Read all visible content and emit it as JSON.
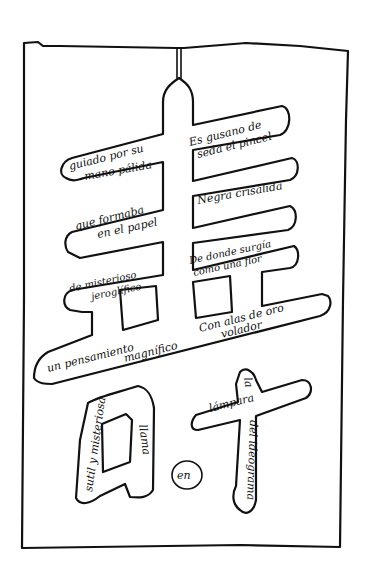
{
  "artwork": {
    "type": "calligram",
    "colors": {
      "ink": "#111111",
      "paper": "#ffffff"
    },
    "upper_character": {
      "lines": [
        {
          "id": "l1a",
          "text": "guiado por su"
        },
        {
          "id": "l1b",
          "text": "mano pálida"
        },
        {
          "id": "l2a",
          "text": "Es gusano de"
        },
        {
          "id": "l2b",
          "text": "seda el pincel"
        },
        {
          "id": "l3a",
          "text": "que formaba"
        },
        {
          "id": "l3b",
          "text": "en el papel"
        },
        {
          "id": "l4a",
          "text": "Negra crisálida"
        },
        {
          "id": "l5a",
          "text": "de misterioso"
        },
        {
          "id": "l5b",
          "text": "jeroglífico"
        },
        {
          "id": "l6a",
          "text": "De donde surgía"
        },
        {
          "id": "l6b",
          "text": "como una flor"
        },
        {
          "id": "l7a",
          "text": "un pensamiento"
        },
        {
          "id": "l7b",
          "text": "magnífico"
        },
        {
          "id": "l8a",
          "text": "Con alas de oro"
        },
        {
          "id": "l8b",
          "text": "volador"
        }
      ]
    },
    "lower_left_character": {
      "lines": [
        {
          "id": "ll1",
          "text": "sutil y misteriosa"
        },
        {
          "id": "ll2",
          "text": "llama"
        }
      ]
    },
    "middle_mark": {
      "text": "en"
    },
    "lower_right_character": {
      "lines": [
        {
          "id": "lr1",
          "text": "la"
        },
        {
          "id": "lr2",
          "text": "lámpara"
        },
        {
          "id": "lr3",
          "text": "del ideograma"
        }
      ]
    }
  }
}
